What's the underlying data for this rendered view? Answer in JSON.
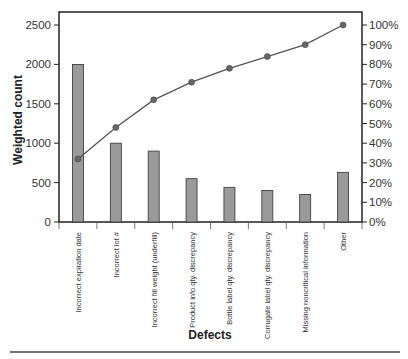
{
  "chart_data": {
    "type": "bar",
    "subtype": "pareto",
    "title": "",
    "xlabel": "Defects",
    "ylabel": "Weighted count",
    "y2label": "",
    "ylim": [
      0,
      2500
    ],
    "y2lim": [
      0,
      100
    ],
    "yticks": [
      "0",
      "500",
      "1000",
      "1500",
      "2000",
      "2500"
    ],
    "y2ticks": [
      "0%",
      "10%",
      "20%",
      "30%",
      "40%",
      "50%",
      "60%",
      "70%",
      "80%",
      "90%",
      "100%"
    ],
    "grid": false,
    "legend": null,
    "categories": [
      "Incorrect expiration date",
      "Incorrect lot #",
      "Incorrect fill weight (underfill)",
      "Product info qty. discrepancy",
      "Bottle label qty. discrepancy",
      "Corrugate label qty. discrepancy",
      "Missing noncritical information",
      "Other"
    ],
    "series": [
      {
        "name": "Weighted count",
        "type": "bar",
        "axis": "left",
        "color": "#9a9a9a",
        "values": [
          2000,
          1000,
          900,
          550,
          440,
          400,
          350,
          630
        ]
      },
      {
        "name": "Cumulative percentage",
        "type": "line",
        "axis": "right",
        "color": "#555555",
        "values": [
          32,
          48,
          62,
          71,
          78,
          84,
          90,
          100
        ]
      }
    ]
  }
}
